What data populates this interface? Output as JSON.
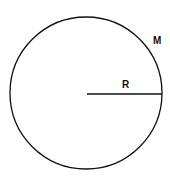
{
  "diagram": {
    "type": "circle",
    "labels": {
      "radius": "R",
      "mass": "M"
    },
    "colors": {
      "stroke": "#111111",
      "background": "#ffffff"
    }
  }
}
